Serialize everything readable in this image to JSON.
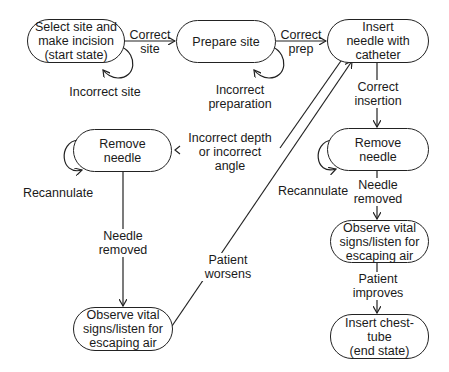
{
  "diagram": {
    "type": "state-transition",
    "nodes": [
      {
        "id": "select_site",
        "label": "Select site and\nmake incision\n(start state)"
      },
      {
        "id": "prepare_site",
        "label": "Prepare site"
      },
      {
        "id": "insert_needle",
        "label": "Insert\nneedle with\ncatheter"
      },
      {
        "id": "remove_needle_left",
        "label": "Remove\nneedle"
      },
      {
        "id": "remove_needle_right",
        "label": "Remove\nneedle"
      },
      {
        "id": "observe_left",
        "label": "Observe vital\nsigns/listen for\nescaping air"
      },
      {
        "id": "observe_right",
        "label": "Observe vital\nsigns/listen for\nescaping air"
      },
      {
        "id": "insert_chest_tube",
        "label": "Insert chest-\ntube\n(end state)"
      }
    ],
    "edges": [
      {
        "from": "select_site",
        "to": "prepare_site",
        "label": "Correct\nsite"
      },
      {
        "from": "select_site",
        "to": "select_site",
        "label": "Incorrect site"
      },
      {
        "from": "prepare_site",
        "to": "insert_needle",
        "label": "Correct\nprep"
      },
      {
        "from": "prepare_site",
        "to": "prepare_site",
        "label": "Incorrect\npreparation"
      },
      {
        "from": "insert_needle",
        "to": "remove_needle_right",
        "label": "Correct\ninsertion"
      },
      {
        "from": "insert_needle",
        "to": "remove_needle_left",
        "label": "Incorrect depth\nor incorrect\nangle"
      },
      {
        "from": "remove_needle_left",
        "to": "remove_needle_left",
        "label": "Recannulate"
      },
      {
        "from": "remove_needle_right",
        "to": "remove_needle_right",
        "label": "Recannulate"
      },
      {
        "from": "remove_needle_left",
        "to": "observe_left",
        "label": "Needle\nremoved"
      },
      {
        "from": "remove_needle_right",
        "to": "observe_right",
        "label": "Needle\nremoved"
      },
      {
        "from": "observe_left",
        "to": "insert_needle",
        "label": "Patient\nworsens"
      },
      {
        "from": "observe_right",
        "to": "insert_chest_tube",
        "label": "Patient\nimproves"
      }
    ]
  }
}
